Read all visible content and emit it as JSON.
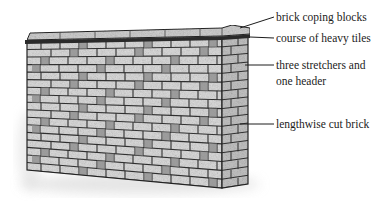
{
  "diagram": {
    "labels": [
      {
        "id": "coping",
        "text": "brick coping blocks",
        "x": 276,
        "y": 10
      },
      {
        "id": "tiles",
        "text": "course of heavy tiles",
        "x": 276,
        "y": 31
      },
      {
        "id": "bond_line1",
        "text": "three stretchers and",
        "x": 276,
        "y": 58
      },
      {
        "id": "bond_line2",
        "text": "one header",
        "x": 276,
        "y": 74
      },
      {
        "id": "cut",
        "text": "lengthwise cut brick",
        "x": 276,
        "y": 117
      }
    ],
    "colors": {
      "ink": "#1c1c1c",
      "brick_face": "#d9d9d9",
      "brick_header": "#8a8a8a",
      "mortar": "#333333",
      "side_face": "#bdbdbd"
    }
  }
}
